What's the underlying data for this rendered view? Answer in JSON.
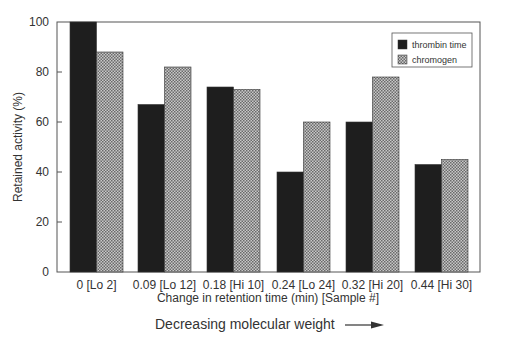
{
  "chart_data": {
    "type": "bar",
    "title": "",
    "xlabel": "Change in retention time (min) [Sample #]",
    "ylabel": "Retained activity (%)",
    "ylim": [
      0,
      100
    ],
    "yticks": [
      0,
      20,
      40,
      60,
      80,
      100
    ],
    "grid": false,
    "legend_position": "upper right",
    "categories": [
      "0 [Lo 2]",
      "0.09 [Lo 12]",
      "0.18 [Hi 10]",
      "0.24 [Lo 24]",
      "0.32 [Hi 20]",
      "0.44 [Hi 30]"
    ],
    "series": [
      {
        "name": "thrombin time",
        "color": "#1e1e1e",
        "pattern": "solid",
        "values": [
          100,
          67,
          74,
          40,
          60,
          43
        ]
      },
      {
        "name": "chromogen",
        "color": "#9a9a9a",
        "pattern": "crosshatch",
        "values": [
          88,
          82,
          73,
          60,
          78,
          45
        ]
      }
    ],
    "annotation": "Decreasing molecular weight"
  },
  "footer": {
    "text": "Decreasing molecular weight",
    "arrow_icon": "right-arrow-icon"
  }
}
